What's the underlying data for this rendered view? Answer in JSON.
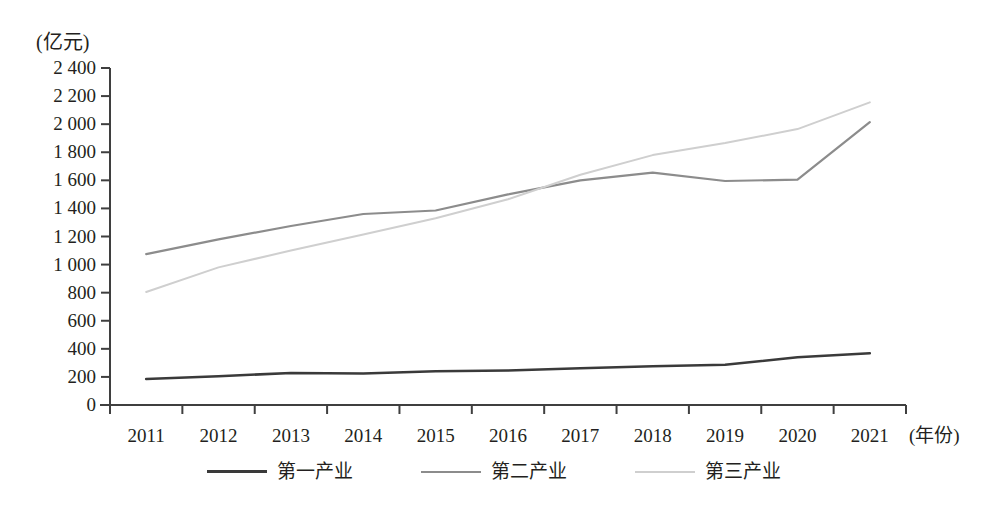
{
  "chart_data": {
    "type": "line",
    "title": "",
    "xlabel": "(年份)",
    "ylabel": "(亿元)",
    "unit_label": "(亿元)",
    "categories": [
      "2011",
      "2012",
      "2013",
      "2014",
      "2015",
      "2016",
      "2017",
      "2018",
      "2019",
      "2020",
      "2021"
    ],
    "x": [
      2011,
      2012,
      2013,
      2014,
      2015,
      2016,
      2017,
      2018,
      2019,
      2020,
      2021
    ],
    "xlim": [
      2011,
      2021
    ],
    "ylim": [
      0,
      2400
    ],
    "yticks": [
      0,
      200,
      400,
      600,
      800,
      1000,
      1200,
      1400,
      1600,
      1800,
      2000,
      2200,
      2400
    ],
    "ytick_labels": [
      "0",
      "200",
      "400",
      "600",
      "800",
      "1 000",
      "1 200",
      "1 400",
      "1 600",
      "1 800",
      "2 000",
      "2 200",
      "2 400"
    ],
    "xtick_labels": [
      "2011",
      "2012",
      "2013",
      "2014",
      "2015",
      "2016",
      "2017",
      "2018",
      "2019",
      "2020",
      "2021"
    ],
    "grid": false,
    "legend_position": "bottom",
    "series": [
      {
        "name": "第一产业",
        "color": "#3a3a3a",
        "width": 2.6,
        "values": [
          185,
          205,
          228,
          224,
          240,
          246,
          262,
          276,
          286,
          340,
          368
        ]
      },
      {
        "name": "第二产业",
        "color": "#8c8c8c",
        "width": 2.2,
        "values": [
          1075,
          1180,
          1275,
          1360,
          1385,
          1500,
          1600,
          1655,
          1595,
          1605,
          2015
        ]
      },
      {
        "name": "第三产业",
        "color": "#cfcfcf",
        "width": 2.0,
        "values": [
          805,
          980,
          1100,
          1215,
          1330,
          1465,
          1640,
          1780,
          1865,
          1965,
          2155
        ]
      }
    ]
  },
  "axis": {
    "y_unit": "(亿元)",
    "x_title": "(年份)"
  },
  "legend": {
    "items": [
      {
        "label": "第一产业",
        "color": "#3a3a3a"
      },
      {
        "label": "第二产业",
        "color": "#8c8c8c"
      },
      {
        "label": "第三产业",
        "color": "#cfcfcf"
      }
    ]
  }
}
